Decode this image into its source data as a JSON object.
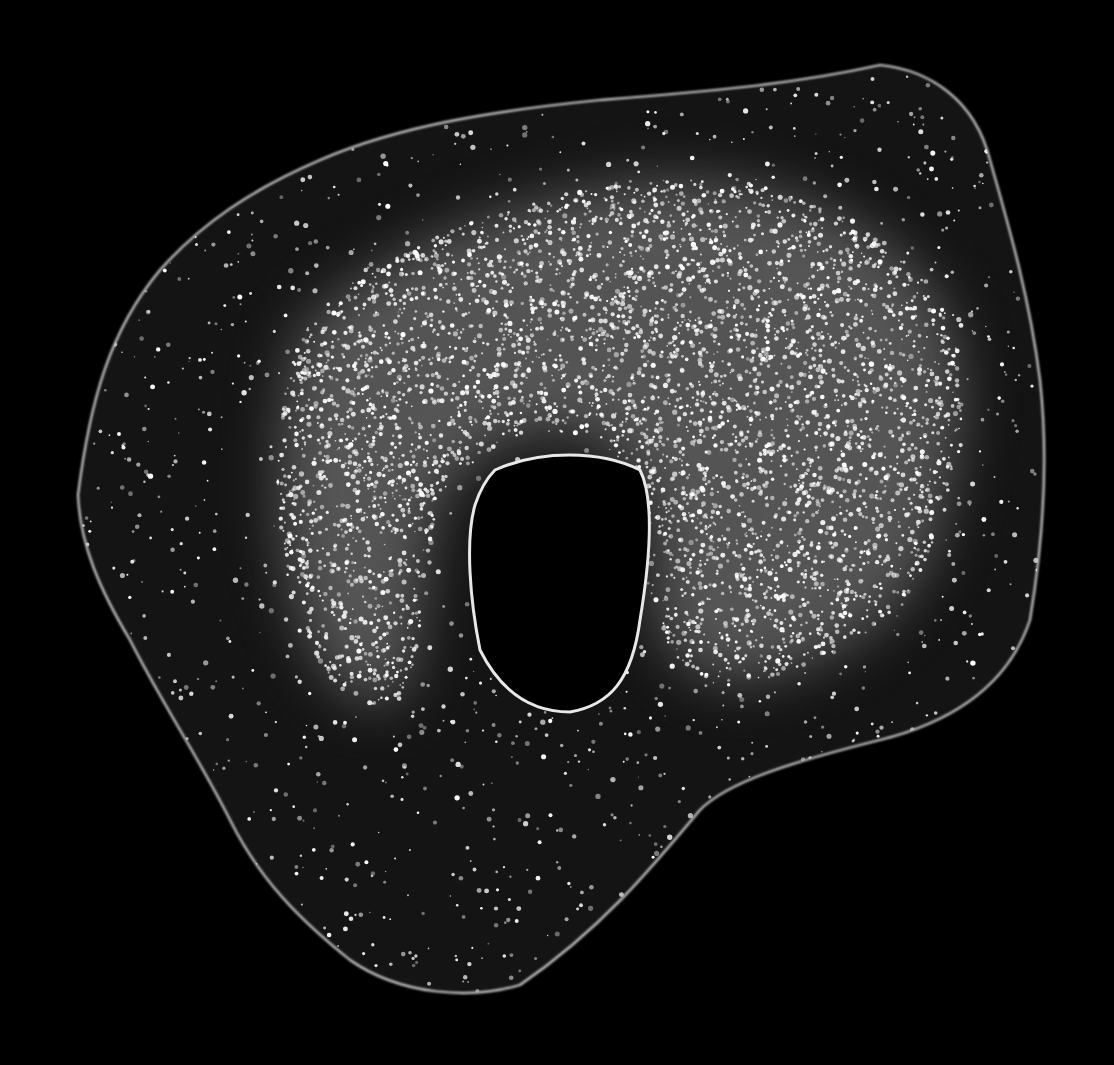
{
  "image": {
    "width": 1114,
    "height": 1065,
    "background": "#000000",
    "subject": "fluorescence micrograph of a single cell with dark nucleus and speckled perinuclear staining"
  },
  "cell": {
    "membrane_color": "#cfcfcf",
    "cytoplasm_color": "#141414",
    "outline_path": "M 78 495 C 90 400 110 330 160 270 C 200 225 250 190 320 160 C 400 125 500 110 600 100 C 700 92 790 85 880 65 C 930 70 975 100 990 160 C 1010 230 1030 300 1040 380 C 1050 470 1040 560 1030 620 C 1010 680 960 720 880 740 C 800 760 730 780 700 810 C 650 870 600 930 520 985 C 470 1000 400 995 350 960 C 300 920 260 880 230 820 C 200 760 160 700 130 640 C 100 590 80 545 78 495 Z"
  },
  "nucleus": {
    "rim_color": "#e8e8e8",
    "interior_color": "#000000",
    "outline_path": "M 495 470 C 540 450 600 450 640 470 C 655 500 650 560 640 620 C 632 680 610 705 570 712 C 530 712 500 690 480 650 C 470 600 465 540 475 505 C 480 490 487 478 495 470 Z"
  },
  "granules": {
    "color": "#ffffff",
    "dense_region_path": "M 300 330 C 380 250 500 200 640 180 C 760 170 880 210 940 300 C 980 380 960 470 930 560 C 900 620 840 660 760 680 C 700 690 660 660 650 600 C 660 520 640 470 600 440 C 540 420 480 440 440 500 C 420 560 430 640 400 700 C 360 720 320 680 300 620 C 270 540 270 420 300 330 Z",
    "dense_count": 4200,
    "sparse_count": 1400,
    "seed": 7
  }
}
